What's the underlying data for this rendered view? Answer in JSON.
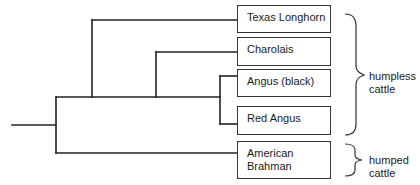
{
  "diagram": {
    "type": "phylogenetic-tree",
    "taxa": [
      {
        "label": "Texas Longhorn"
      },
      {
        "label": "Charolais"
      },
      {
        "label": "Angus (black)"
      },
      {
        "label": "Red Angus"
      },
      {
        "label": "American Brahman",
        "line1": "American",
        "line2": "Brahman"
      }
    ],
    "groups": [
      {
        "label_line1": "humpless",
        "label_line2": "cattle",
        "members": [
          "Texas Longhorn",
          "Charolais",
          "Angus (black)",
          "Red Angus"
        ]
      },
      {
        "label_line1": "humped",
        "label_line2": "cattle",
        "members": [
          "American Brahman"
        ]
      }
    ],
    "topology": "((Texas Longhorn,(Charolais,(Angus (black),Red Angus))),American Brahman)",
    "colors": {
      "line": "#222222",
      "box_border": "#333333",
      "text": "#1a1a1a",
      "background": "#ffffff"
    }
  }
}
